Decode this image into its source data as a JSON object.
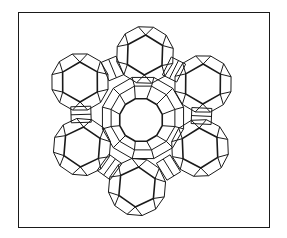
{
  "figure": {
    "style": "black line drawing on white",
    "frame_color": "#1a1a1a",
    "background": "#ffffff",
    "cages": [
      {
        "id": "top",
        "cx": 145,
        "cy": 55
      },
      {
        "id": "upper-left",
        "cx": 80,
        "cy": 82
      },
      {
        "id": "upper-right",
        "cx": 203,
        "cy": 84
      },
      {
        "id": "lower-left",
        "cx": 82,
        "cy": 147
      },
      {
        "id": "lower-right",
        "cx": 200,
        "cy": 148
      },
      {
        "id": "bottom",
        "cx": 137,
        "cy": 187
      }
    ],
    "central_pore": {
      "cx": 143,
      "cy": 118
    }
  }
}
